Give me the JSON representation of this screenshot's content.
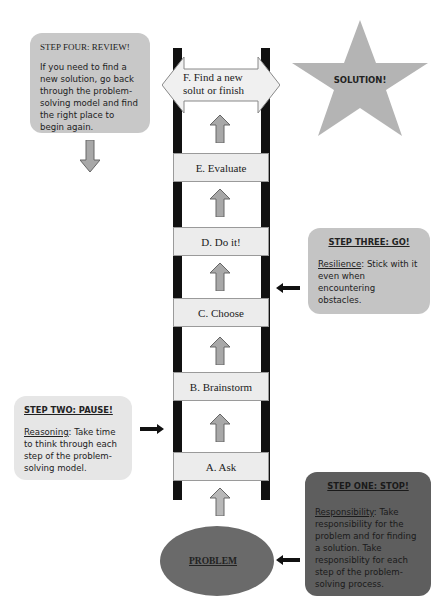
{
  "diagram": {
    "title_star": "SOLUTION!",
    "problem_label": "PROBLEM",
    "top_arrow_label": "F. Find a new solut or finish",
    "rungs": [
      {
        "label": "E. Evaluate"
      },
      {
        "label": "D. Do it!"
      },
      {
        "label": "C. Choose"
      },
      {
        "label": "B. Brainstorm"
      },
      {
        "label": "A. Ask"
      }
    ],
    "cards": {
      "step_four": {
        "title": "STEP FOUR: REVIEW!",
        "body": "If you need to find a new solution, go back through the problem-solving model and find the right place to begin again."
      },
      "step_three": {
        "title": "STEP THREE: GO!",
        "term": "Resilience",
        "body": ": Stick with it even when encountering obstacles."
      },
      "step_two": {
        "title": "STEP TWO: PAUSE!",
        "term": "Reasoning",
        "body": ": Take time to think through each step of the problem-solving model."
      },
      "step_one": {
        "title": "STEP ONE: STOP!",
        "term": "Responsibility",
        "body": ": Take responsibility for the problem and for finding a solution. Take responsiblity for each step of the problem-solving process."
      }
    },
    "colors": {
      "card_light": "#c8c8c8",
      "card_lightest": "#e6e6e6",
      "card_dark": "#5e5e5e",
      "star": "#b4b4b4",
      "problem_ellipse": "#6a6a6a",
      "arrow_fill": "#a8a8a8",
      "rail": "#111111"
    }
  }
}
